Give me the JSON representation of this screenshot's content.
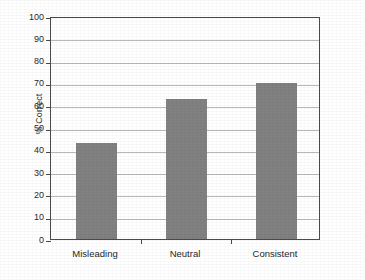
{
  "chart_data": {
    "type": "bar",
    "title": "",
    "subtitle": "",
    "xlabel": "",
    "ylabel": "% Correct",
    "categories": [
      "Misleading",
      "Neutral",
      "Consistent"
    ],
    "values": [
      43,
      63,
      70
    ],
    "ylim": [
      0,
      100
    ],
    "ytick_values": [
      0,
      10,
      20,
      30,
      40,
      50,
      60,
      70,
      80,
      90,
      100
    ],
    "ytick_labels": [
      "0",
      "10",
      "20",
      "30",
      "40",
      "50",
      "60",
      "70",
      "80",
      "90",
      "100"
    ],
    "grid": "horizontal",
    "legend": "none",
    "annotations": [],
    "series": [
      {
        "name": "% Correct",
        "values": [
          43,
          63,
          70
        ],
        "color": "#818181"
      }
    ],
    "colors": {
      "bar_fill": "#818181",
      "gridline": "#b9b9b9",
      "axis": "#4a4a4a",
      "background": "#ffffff",
      "text": "#1f1f1f"
    }
  }
}
